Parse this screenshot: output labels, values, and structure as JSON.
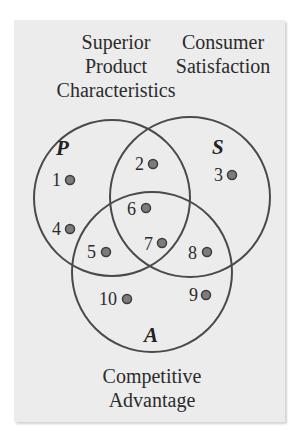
{
  "diagram": {
    "type": "venn",
    "sets": [
      {
        "id": "P",
        "letter": "P",
        "title_lines": [
          "Superior",
          "Product",
          "Characteristics"
        ]
      },
      {
        "id": "S",
        "letter": "S",
        "title_lines": [
          "Consumer",
          "Satisfaction"
        ]
      },
      {
        "id": "A",
        "letter": "A",
        "title_lines": [
          "Competitive",
          "Advantage"
        ]
      }
    ],
    "points": [
      {
        "label": "1",
        "region": "P only"
      },
      {
        "label": "2",
        "region": "P and S only"
      },
      {
        "label": "3",
        "region": "S only"
      },
      {
        "label": "4",
        "region": "P only"
      },
      {
        "label": "5",
        "region": "P and A only"
      },
      {
        "label": "6",
        "region": "P, S and A"
      },
      {
        "label": "7",
        "region": "P, S and A"
      },
      {
        "label": "8",
        "region": "S and A only"
      },
      {
        "label": "9",
        "region": "A only"
      },
      {
        "label": "10",
        "region": "A only"
      }
    ],
    "colors": {
      "panel": "#ececec",
      "circle_stroke": "#4a4a4a",
      "dot_fill": "#7c7c7c",
      "dot_stroke": "#3c3c3c"
    }
  }
}
